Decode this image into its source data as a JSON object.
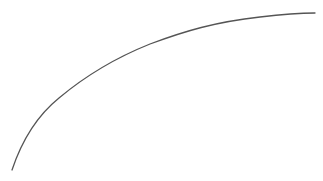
{
  "canvas": {
    "width": 323,
    "height": 181,
    "background": "#ffffff"
  },
  "curve": {
    "stroke": "#555555",
    "stroke_width": 1.3,
    "path": "M12,170 C22,140 38,115 59,98 C90,72 120,56 150,44 C185,31 215,22 260,17 C285,14 300,13 315,13"
  }
}
